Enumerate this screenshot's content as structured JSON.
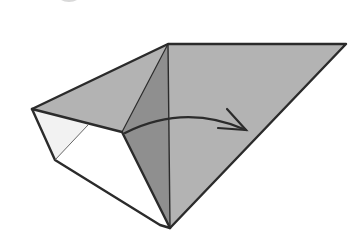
{
  "diagram": {
    "type": "origami-fold-step",
    "colors": {
      "background": "#ffffff",
      "paper_main": "#b3b3b3",
      "paper_dark": "#8f8f8f",
      "paper_light": "#f2f2f2",
      "paper_white": "#ffffff",
      "outline": "#2b2b2b",
      "step_badge": "#d9d9d9"
    },
    "vertices": {
      "top_center": [
        168,
        44
      ],
      "top_right": [
        346,
        44
      ],
      "left": [
        32,
        109
      ],
      "mid": [
        122,
        132
      ],
      "lower_left": [
        55,
        160
      ],
      "bottom_white": [
        160,
        225
      ],
      "bottom": [
        170,
        228
      ],
      "light_crease_top": [
        88,
        125
      ]
    },
    "arrow": {
      "direction": "right",
      "start": [
        125,
        133
      ],
      "tip": [
        246,
        130
      ]
    }
  }
}
